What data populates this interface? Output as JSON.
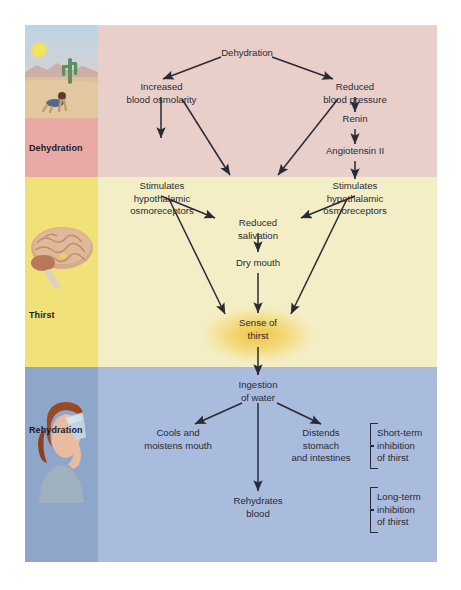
{
  "figure": {
    "colors": {
      "band_dehydration": "#e8cfca",
      "band_thirst": "#f4eec6",
      "band_rehydration": "#a9bcdd",
      "strip_dehydration": "#e9a9a4",
      "strip_thirst": "#f0e178",
      "strip_rehydration": "#8fa6cb",
      "text": "#2a2a36",
      "glow": "#f0be28"
    }
  },
  "bands": [
    {
      "name": "dehydration",
      "label": "Dehydration",
      "photo": "desert-photo"
    },
    {
      "name": "thirst",
      "label": "Thirst",
      "photo": "brain-photo"
    },
    {
      "name": "rehydration",
      "label": "Rehydration",
      "photo": "woman-drinking-photo"
    }
  ],
  "nodes": {
    "dehydration": "Dehydration",
    "increased_osmolarity": "Increased\nblood osmolarity",
    "reduced_pressure": "Reduced\nblood pressure",
    "renin": "Renin",
    "angiotensin": "Angiotensin II",
    "osmoreceptors_left": "Stimulates\nhypothalamic\nosmoreceptors",
    "osmoreceptors_right": "Stimulates\nhypothalamic\nosmoreceptors",
    "reduced_salivation": "Reduced\nsalivation",
    "dry_mouth": "Dry mouth",
    "sense_of_thirst": "Sense of\nthirst",
    "ingestion": "Ingestion\nof water",
    "cools_mouth": "Cools and\nmoistens mouth",
    "distends_stomach": "Distends\nstomach\nand intestines",
    "rehydrates_blood": "Rehydrates\nblood",
    "short_term": "Short-term\ninhibition\nof thirst",
    "long_term": "Long-term\ninhibition\nof thirst"
  },
  "chart_data": {
    "type": "diagram",
    "edges": [
      {
        "from": "Dehydration",
        "to": "Increased blood osmolarity"
      },
      {
        "from": "Dehydration",
        "to": "Reduced blood pressure"
      },
      {
        "from": "Increased blood osmolarity",
        "to": "Stimulates hypothalamic osmoreceptors (left)"
      },
      {
        "from": "Increased blood osmolarity",
        "to": "Reduced salivation"
      },
      {
        "from": "Reduced blood pressure",
        "to": "Renin"
      },
      {
        "from": "Reduced blood pressure",
        "to": "Reduced salivation"
      },
      {
        "from": "Renin",
        "to": "Angiotensin II"
      },
      {
        "from": "Angiotensin II",
        "to": "Stimulates hypothalamic osmoreceptors (right)"
      },
      {
        "from": "Stimulates hypothalamic osmoreceptors (left)",
        "to": "Reduced salivation"
      },
      {
        "from": "Stimulates hypothalamic osmoreceptors (left)",
        "to": "Sense of thirst"
      },
      {
        "from": "Stimulates hypothalamic osmoreceptors (right)",
        "to": "Reduced salivation"
      },
      {
        "from": "Stimulates hypothalamic osmoreceptors (right)",
        "to": "Sense of thirst"
      },
      {
        "from": "Reduced salivation",
        "to": "Dry mouth"
      },
      {
        "from": "Dry mouth",
        "to": "Sense of thirst"
      },
      {
        "from": "Sense of thirst",
        "to": "Ingestion of water"
      },
      {
        "from": "Ingestion of water",
        "to": "Cools and moistens mouth"
      },
      {
        "from": "Ingestion of water",
        "to": "Distends stomach and intestines"
      },
      {
        "from": "Ingestion of water",
        "to": "Rehydrates blood"
      }
    ],
    "groupings": [
      {
        "label": "Short-term inhibition of thirst",
        "members": [
          "Cools and moistens mouth",
          "Distends stomach and intestines"
        ]
      },
      {
        "label": "Long-term inhibition of thirst",
        "members": [
          "Rehydrates blood"
        ]
      }
    ]
  }
}
